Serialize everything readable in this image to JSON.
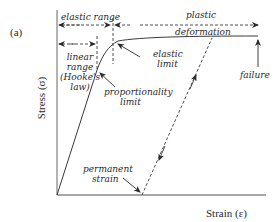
{
  "figure": {
    "panel_label": "(a)",
    "y_axis_label": "Stress (σ)",
    "x_axis_label": "Strain (ε)"
  },
  "annotations": {
    "elastic_range": "elastic range",
    "plastic": "plastic",
    "deformation": "deformation",
    "linear_1": "linear",
    "linear_2": "range",
    "linear_3": "(Hooke's",
    "linear_4": "law)",
    "elastic_limit_1": "elastic",
    "elastic_limit_2": "limit",
    "proportionality_1": "proportionality",
    "proportionality_2": "limit",
    "failure": "failure",
    "permanent_1": "permanent",
    "permanent_2": "strain"
  },
  "colors": {
    "line": "#3a3a3a",
    "axis": "#8a8a8a",
    "text": "#2a2a2a"
  }
}
